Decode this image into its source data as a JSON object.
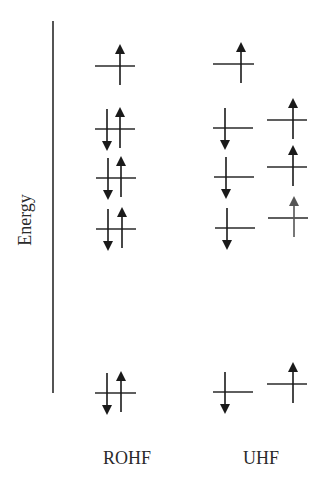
{
  "axis": {
    "label": "Energy",
    "x": 53,
    "y_top": 21,
    "y_bottom": 393
  },
  "columns": {
    "rohf": {
      "label": "ROHF"
    },
    "uhf": {
      "label": "UHF"
    }
  },
  "colors": {
    "line": "#2a2a2a",
    "arrow": "#1a1a1a",
    "arrow_faded": "#555555"
  },
  "levels": [
    {
      "method": "ROHF",
      "x1": 95,
      "x2": 135,
      "y": 66,
      "electrons": [
        {
          "spin": "up",
          "x": 120
        }
      ]
    },
    {
      "method": "ROHF",
      "x1": 95,
      "x2": 135,
      "y": 129,
      "electrons": [
        {
          "spin": "down",
          "x": 107
        },
        {
          "spin": "up",
          "x": 120
        }
      ]
    },
    {
      "method": "ROHF",
      "x1": 96,
      "x2": 136,
      "y": 178,
      "electrons": [
        {
          "spin": "down",
          "x": 108
        },
        {
          "spin": "up",
          "x": 121
        }
      ]
    },
    {
      "method": "ROHF",
      "x1": 96,
      "x2": 136,
      "y": 229,
      "electrons": [
        {
          "spin": "down",
          "x": 108
        },
        {
          "spin": "up",
          "x": 122
        }
      ]
    },
    {
      "method": "ROHF",
      "x1": 95,
      "x2": 136,
      "y": 393,
      "electrons": [
        {
          "spin": "down",
          "x": 107
        },
        {
          "spin": "up",
          "x": 121
        }
      ]
    },
    {
      "method": "UHF-alpha-beta-left",
      "x1": 213,
      "x2": 254,
      "y": 64,
      "electrons": [
        {
          "spin": "up",
          "x": 241
        }
      ]
    },
    {
      "method": "UHF-beta",
      "x1": 213,
      "x2": 253,
      "y": 128,
      "electrons": [
        {
          "spin": "down",
          "x": 225
        }
      ]
    },
    {
      "method": "UHF-beta",
      "x1": 214,
      "x2": 254,
      "y": 177,
      "electrons": [
        {
          "spin": "down",
          "x": 226
        }
      ]
    },
    {
      "method": "UHF-beta",
      "x1": 215,
      "x2": 255,
      "y": 228,
      "electrons": [
        {
          "spin": "down",
          "x": 227
        }
      ]
    },
    {
      "method": "UHF-beta",
      "x1": 213,
      "x2": 253,
      "y": 392,
      "electrons": [
        {
          "spin": "down",
          "x": 225
        }
      ]
    },
    {
      "method": "UHF-alpha",
      "x1": 267,
      "x2": 307,
      "y": 120,
      "electrons": [
        {
          "spin": "up",
          "x": 293
        }
      ]
    },
    {
      "method": "UHF-alpha",
      "x1": 267,
      "x2": 307,
      "y": 167,
      "electrons": [
        {
          "spin": "up",
          "x": 293
        }
      ]
    },
    {
      "method": "UHF-alpha",
      "x1": 268,
      "x2": 308,
      "y": 218,
      "electrons": [
        {
          "spin": "up",
          "x": 294,
          "faded": true
        }
      ]
    },
    {
      "method": "UHF-alpha",
      "x1": 267,
      "x2": 307,
      "y": 384,
      "electrons": [
        {
          "spin": "up",
          "x": 293
        }
      ]
    }
  ]
}
